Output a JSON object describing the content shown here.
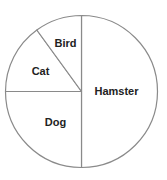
{
  "chart_data": {
    "type": "pie",
    "title": "",
    "categories": [
      "Hamster",
      "Dog",
      "Cat",
      "Bird"
    ],
    "values": [
      50,
      25,
      15,
      10
    ],
    "unit": "percent",
    "start_angle_deg": 0,
    "direction": "clockwise-from-top",
    "legend": "none (labels drawn inside slices)",
    "colors": {
      "fill": "#ffffff",
      "stroke": "#8a8a8a",
      "label": "#222222"
    },
    "geometry": {
      "cx": 81.5,
      "cy": 91.5,
      "r": 76
    },
    "labels": [
      {
        "text": "Hamster",
        "x": 116.5,
        "y": 95
      },
      {
        "text": "Dog",
        "x": 55.5,
        "y": 126
      },
      {
        "text": "Cat",
        "x": 40.5,
        "y": 75
      },
      {
        "text": "Bird",
        "x": 65.5,
        "y": 47
      }
    ]
  }
}
